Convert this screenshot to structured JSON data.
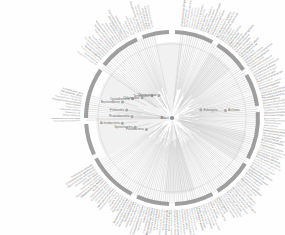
{
  "figure": {
    "type": "radial-dendrogram",
    "background_color": "#fefefe",
    "branch_color": "#b9b9b9",
    "ring_color": "#7c7c7c",
    "label_color": "#6a6a6a",
    "wedge_color": "#f1f1f1",
    "node_color": "#9a9a9a"
  },
  "root": {
    "label": "Bact",
    "cx": 172,
    "cy": 118
  },
  "geometry": {
    "center_x": 172,
    "center_y": 118,
    "inner_arc_radius": 74,
    "ring_radius": 86,
    "leaf_radius": 88,
    "label_radius": 92,
    "gap_sectors": [
      {
        "start": 150,
        "end": 178
      },
      {
        "start": 196,
        "end": 214
      },
      {
        "start": 258,
        "end": 276
      }
    ]
  },
  "internal_nodes": [
    {
      "label": "Proteobacteria",
      "angle": 182,
      "radius": 40
    },
    {
      "label": "Firmicutes",
      "angle": 190,
      "radius": 46
    },
    {
      "label": "Actinobacteria",
      "angle": 174,
      "radius": 50
    },
    {
      "label": "Bacteroidetes",
      "angle": 198,
      "radius": 52
    },
    {
      "label": "Cyanobacteria",
      "angle": 206,
      "radius": 44
    },
    {
      "label": "Spirochaetes",
      "angle": 166,
      "radius": 38
    },
    {
      "label": "Chlamydiae",
      "angle": 214,
      "radius": 36
    },
    {
      "label": "Archaea",
      "angle": 352,
      "radius": 54
    },
    {
      "label": "Eukaryota",
      "angle": 344,
      "radius": 30
    },
    {
      "label": "Tenericutes",
      "angle": 228,
      "radius": 30
    },
    {
      "label": "Fusobacteria",
      "angle": 156,
      "radius": 28
    },
    {
      "label": "Thermotogae",
      "angle": 240,
      "radius": 26
    }
  ],
  "clade_arcs": [
    {
      "start_angle": 118,
      "end_angle": 152,
      "thickness": 4
    },
    {
      "start_angle": 155,
      "end_angle": 176,
      "thickness": 4
    },
    {
      "start_angle": 180,
      "end_angle": 214,
      "thickness": 4
    },
    {
      "start_angle": 218,
      "end_angle": 246,
      "thickness": 4
    },
    {
      "start_angle": 250,
      "end_angle": 268,
      "thickness": 4
    },
    {
      "start_angle": 272,
      "end_angle": 298,
      "thickness": 4
    },
    {
      "start_angle": 302,
      "end_angle": 326,
      "thickness": 4
    },
    {
      "start_angle": 330,
      "end_angle": 352,
      "thickness": 4
    },
    {
      "start_angle": 356,
      "end_angle": 28,
      "thickness": 4
    },
    {
      "start_angle": 32,
      "end_angle": 58,
      "thickness": 4
    },
    {
      "start_angle": 62,
      "end_angle": 88,
      "thickness": 4
    },
    {
      "start_angle": 92,
      "end_angle": 114,
      "thickness": 4
    }
  ],
  "wedges": [
    {
      "start_angle": 150,
      "end_angle": 180,
      "radius": 76
    },
    {
      "start_angle": 196,
      "end_angle": 216,
      "radius": 76
    },
    {
      "start_angle": 258,
      "end_angle": 278,
      "radius": 76
    },
    {
      "start_angle": 300,
      "end_angle": 320,
      "radius": 76
    },
    {
      "start_angle": 10,
      "end_angle": 34,
      "radius": 76
    },
    {
      "start_angle": 72,
      "end_angle": 96,
      "radius": 76
    }
  ],
  "leaves": {
    "count": 236,
    "sample_labels": [
      "Escherichia coli",
      "Salmonella enterica",
      "Shigella flexneri",
      "Vibrio cholerae",
      "Pseudomonas aeruginosa",
      "Haemophilus influenzae",
      "Neisseria meningitidis",
      "Helicobacter pylori",
      "Campylobacter jejuni",
      "Rickettsia prowazekii",
      "Bacillus subtilis",
      "Staphylococcus aureus",
      "Streptococcus pneumoniae",
      "Listeria monocytogenes",
      "Clostridium difficile",
      "Lactobacillus plantarum",
      "Mycobacterium tuberculosis",
      "Corynebacterium glutamicum",
      "Streptomyces coelicolor",
      "Bifidobacterium longum",
      "Bacteroides fragilis",
      "Porphyromonas gingivalis",
      "Synechocystis sp.",
      "Prochlorococcus marinus",
      "Borrelia burgdorferi",
      "Treponema pallidum",
      "Chlamydia trachomatis",
      "Mycoplasma genitalium",
      "Thermotoga maritima",
      "Aquifex aeolicus",
      "Deinococcus radiodurans",
      "Fusobacterium nucleatum",
      "Methanocaldococcus jannaschii",
      "Sulfolobus solfataricus",
      "Halobacterium salinarum",
      "Pyrococcus furiosus",
      "Archaeoglobus fulgidus",
      "Thermoplasma acidophilum",
      "Saccharomyces cerevisiae",
      "Homo sapiens"
    ]
  }
}
